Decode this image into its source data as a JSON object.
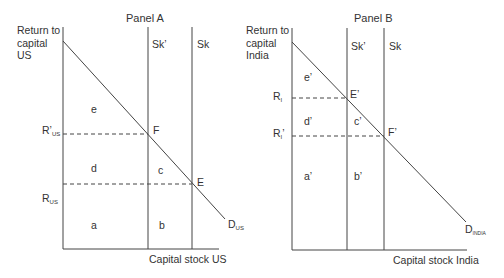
{
  "panel_a": {
    "title": "Panel A",
    "y_axis_label": [
      "Return to",
      "capital",
      "US"
    ],
    "x_axis_label": "Capital stock US",
    "supply_prime": "Sk’",
    "supply": "Sk",
    "r_prime": {
      "main": "R’",
      "sub": "US"
    },
    "r": {
      "main": "R",
      "sub": "US"
    },
    "demand": {
      "main": "D",
      "sub": "US"
    },
    "points": {
      "f": "F",
      "e": "E"
    },
    "areas": {
      "a": "a",
      "b": "b",
      "c": "c",
      "d": "d",
      "e": "e"
    }
  },
  "panel_b": {
    "title": "Panel B",
    "y_axis_label": [
      "Return to",
      "capital",
      "India"
    ],
    "x_axis_label": "Capital stock India",
    "supply_prime": "Sk’",
    "supply": "Sk",
    "r": {
      "main": "R",
      "sub": "I"
    },
    "r_prime": {
      "main": "R",
      "sub": "I",
      "prime": "’"
    },
    "demand": {
      "main": "D",
      "sub": "INDIA"
    },
    "points": {
      "e": "E’",
      "f": "F’"
    },
    "areas": {
      "a": "a’",
      "b": "b’",
      "c": "c’",
      "d": "d’",
      "e": "e’"
    }
  }
}
